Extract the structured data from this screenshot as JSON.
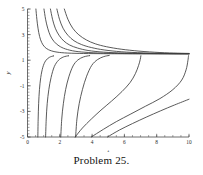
{
  "caption": "Problem 25.",
  "chart_data": {
    "type": "line",
    "title": "",
    "xlabel": "t",
    "ylabel": "y",
    "xlim": [
      0,
      10
    ],
    "ylim": [
      -5,
      5
    ],
    "grid": false,
    "legend": "none",
    "x_ticks": [
      0,
      2,
      4,
      6,
      8,
      10
    ],
    "x_tick_labels": [
      "0",
      "2",
      "4",
      "6",
      "8",
      "10"
    ],
    "x_minor_step": 0.5,
    "y_ticks": [
      5,
      3,
      1,
      -1,
      -3,
      -5
    ],
    "y_tick_labels": [
      "5",
      "3",
      "1",
      "-1",
      "-3",
      "-5"
    ],
    "y_minor_step": 0.25,
    "asymptote_y": 1.5,
    "annotations": [
      "All solution curves approach the horizontal asymptote y = 1.5 as t increases.",
      "Each lower branch rises from y = -5 with a vertical asymptote, then flattens toward y = 1.5."
    ],
    "series": [
      {
        "name": "upper-branch-1",
        "comment": "steep decay entering top edge near t=0.55",
        "points": [
          [
            0.52,
            5.0
          ],
          [
            0.58,
            4.2
          ],
          [
            0.65,
            3.5
          ],
          [
            0.75,
            2.85
          ],
          [
            0.88,
            2.38
          ],
          [
            1.05,
            2.05
          ],
          [
            1.3,
            1.82
          ],
          [
            1.7,
            1.66
          ],
          [
            2.3,
            1.57
          ],
          [
            3.2,
            1.53
          ],
          [
            4.5,
            1.51
          ],
          [
            6.5,
            1.5
          ],
          [
            10,
            1.5
          ]
        ]
      },
      {
        "name": "upper-branch-2",
        "comment": "enters top edge near t=1.05",
        "points": [
          [
            1.02,
            5.0
          ],
          [
            1.12,
            4.2
          ],
          [
            1.25,
            3.5
          ],
          [
            1.42,
            2.9
          ],
          [
            1.65,
            2.45
          ],
          [
            1.95,
            2.12
          ],
          [
            2.35,
            1.88
          ],
          [
            2.95,
            1.7
          ],
          [
            3.8,
            1.6
          ],
          [
            5.0,
            1.54
          ],
          [
            6.8,
            1.51
          ],
          [
            10,
            1.5
          ]
        ]
      },
      {
        "name": "upper-branch-3",
        "comment": "enters top edge near t=1.45",
        "points": [
          [
            1.42,
            5.0
          ],
          [
            1.55,
            4.2
          ],
          [
            1.72,
            3.5
          ],
          [
            1.95,
            2.95
          ],
          [
            2.25,
            2.5
          ],
          [
            2.62,
            2.18
          ],
          [
            3.1,
            1.95
          ],
          [
            3.75,
            1.76
          ],
          [
            4.7,
            1.63
          ],
          [
            6.0,
            1.56
          ],
          [
            7.8,
            1.52
          ],
          [
            10,
            1.5
          ]
        ]
      },
      {
        "name": "upper-branch-4",
        "comment": "enters top edge near t=1.85",
        "points": [
          [
            1.82,
            5.0
          ],
          [
            1.98,
            4.2
          ],
          [
            2.2,
            3.5
          ],
          [
            2.5,
            2.95
          ],
          [
            2.88,
            2.52
          ],
          [
            3.35,
            2.22
          ],
          [
            3.95,
            1.99
          ],
          [
            4.75,
            1.8
          ],
          [
            5.8,
            1.66
          ],
          [
            7.2,
            1.57
          ],
          [
            8.8,
            1.52
          ],
          [
            10,
            1.51
          ]
        ]
      },
      {
        "name": "upper-branch-5",
        "comment": "enters top edge near t=2.3, shallowest decay",
        "points": [
          [
            2.28,
            5.0
          ],
          [
            2.5,
            4.2
          ],
          [
            2.8,
            3.5
          ],
          [
            3.18,
            2.98
          ],
          [
            3.65,
            2.58
          ],
          [
            4.2,
            2.28
          ],
          [
            4.9,
            2.05
          ],
          [
            5.8,
            1.86
          ],
          [
            6.9,
            1.71
          ],
          [
            8.2,
            1.6
          ],
          [
            9.3,
            1.55
          ],
          [
            10,
            1.53
          ]
        ]
      },
      {
        "name": "lower-branch-1",
        "comment": "vertical asymptote near t=0.62, rises to y=1.5",
        "points": [
          [
            0.64,
            -5.0
          ],
          [
            0.66,
            -3.6
          ],
          [
            0.69,
            -2.4
          ],
          [
            0.74,
            -1.3
          ],
          [
            0.82,
            -0.35
          ],
          [
            0.95,
            0.45
          ],
          [
            1.12,
            0.95
          ],
          [
            1.35,
            1.22
          ],
          [
            1.62,
            1.34
          ],
          [
            1.62,
            1.34
          ]
        ]
      },
      {
        "name": "lower-branch-2",
        "comment": "vertical asymptote near t=1.1",
        "points": [
          [
            1.12,
            -5.0
          ],
          [
            1.16,
            -3.6
          ],
          [
            1.22,
            -2.4
          ],
          [
            1.32,
            -1.3
          ],
          [
            1.46,
            -0.35
          ],
          [
            1.66,
            0.5
          ],
          [
            1.92,
            1.0
          ],
          [
            2.22,
            1.25
          ],
          [
            2.55,
            1.35
          ],
          [
            2.55,
            1.35
          ]
        ]
      },
      {
        "name": "lower-branch-3",
        "comment": "vertical asymptote near t=2.05",
        "points": [
          [
            2.06,
            -5.0
          ],
          [
            2.12,
            -3.6
          ],
          [
            2.22,
            -2.4
          ],
          [
            2.36,
            -1.3
          ],
          [
            2.56,
            -0.3
          ],
          [
            2.82,
            0.55
          ],
          [
            3.12,
            1.02
          ],
          [
            3.48,
            1.26
          ],
          [
            3.85,
            1.36
          ],
          [
            3.85,
            1.36
          ]
        ]
      },
      {
        "name": "lower-branch-4",
        "comment": "vertical asymptote near t=2.95",
        "points": [
          [
            2.98,
            -5.0
          ],
          [
            3.06,
            -3.6
          ],
          [
            3.2,
            -2.4
          ],
          [
            3.4,
            -1.3
          ],
          [
            3.66,
            -0.25
          ],
          [
            3.98,
            0.6
          ],
          [
            4.34,
            1.05
          ],
          [
            4.72,
            1.28
          ],
          [
            5.05,
            1.37
          ],
          [
            5.05,
            1.37
          ]
        ]
      },
      {
        "name": "lower-branch-5",
        "comment": "long shallow rise, vertical asymptote near t=7.0",
        "points": [
          [
            2.95,
            -5.0
          ],
          [
            3.4,
            -4.3
          ],
          [
            3.95,
            -3.6
          ],
          [
            4.55,
            -2.9
          ],
          [
            5.2,
            -2.2
          ],
          [
            5.85,
            -1.45
          ],
          [
            6.35,
            -0.75
          ],
          [
            6.68,
            -0.05
          ],
          [
            6.88,
            0.6
          ],
          [
            6.98,
            1.05
          ],
          [
            7.02,
            1.35
          ]
        ]
      },
      {
        "name": "lower-branch-6",
        "comment": "longest shallow rise, vertical asymptote near t=9.95",
        "points": [
          [
            3.95,
            -5.0
          ],
          [
            4.7,
            -4.4
          ],
          [
            5.5,
            -3.8
          ],
          [
            6.4,
            -3.2
          ],
          [
            7.3,
            -2.6
          ],
          [
            8.2,
            -2.0
          ],
          [
            9.0,
            -1.3
          ],
          [
            9.55,
            -0.55
          ],
          [
            9.82,
            0.25
          ],
          [
            9.93,
            0.95
          ],
          [
            9.97,
            1.35
          ]
        ]
      },
      {
        "name": "lower-branch-7",
        "comment": "flattest curve reaching right edge below asymptote",
        "points": [
          [
            4.95,
            -5.0
          ],
          [
            5.7,
            -4.45
          ],
          [
            6.5,
            -3.95
          ],
          [
            7.35,
            -3.45
          ],
          [
            8.25,
            -2.95
          ],
          [
            9.1,
            -2.5
          ],
          [
            10.0,
            -2.05
          ]
        ]
      }
    ]
  }
}
